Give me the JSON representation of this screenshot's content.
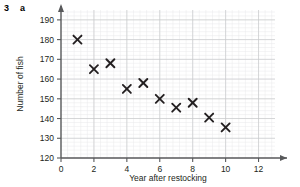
{
  "question": {
    "number": "3",
    "part": "a"
  },
  "chart_data": {
    "type": "scatter",
    "title": "",
    "xlabel": "Year after restocking",
    "ylabel": "Number of fish",
    "xlim": [
      0,
      13
    ],
    "ylim": [
      120,
      195
    ],
    "xticks": [
      "0",
      "2",
      "4",
      "6",
      "8",
      "10",
      "12"
    ],
    "xtick_values": [
      0,
      2,
      4,
      6,
      8,
      10,
      12
    ],
    "yticks": [
      "120",
      "130",
      "140",
      "150",
      "160",
      "170",
      "180",
      "190"
    ],
    "ytick_values": [
      120,
      130,
      140,
      150,
      160,
      170,
      180,
      190
    ],
    "grid": true,
    "grid_minor_step_x": 0.4,
    "grid_minor_step_y": 2,
    "legend": null,
    "marker": "x-cross",
    "marker_color": "#231f20",
    "x": [
      1,
      2,
      3,
      4,
      5,
      6,
      7,
      8,
      9,
      10
    ],
    "values": [
      180,
      165,
      168,
      155,
      158,
      150,
      145.5,
      148,
      140.5,
      135.5
    ],
    "points": [
      {
        "x": 1,
        "y": 180
      },
      {
        "x": 2,
        "y": 165
      },
      {
        "x": 3,
        "y": 168
      },
      {
        "x": 4,
        "y": 155
      },
      {
        "x": 5,
        "y": 158
      },
      {
        "x": 6,
        "y": 150
      },
      {
        "x": 7,
        "y": 145.5
      },
      {
        "x": 8,
        "y": 148
      },
      {
        "x": 9,
        "y": 140.5
      },
      {
        "x": 10,
        "y": 135.5
      }
    ],
    "colors": {
      "axis": "#58595b",
      "grid_major": "#c8c9cb",
      "grid_minor": "#e4e5e7",
      "marker": "#231f20",
      "background": "#ffffff"
    }
  }
}
